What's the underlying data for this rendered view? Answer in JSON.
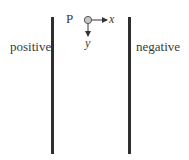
{
  "diagram": {
    "plates": {
      "left": {
        "label": "positive"
      },
      "right": {
        "label": "negative"
      }
    },
    "particle": {
      "label": "P",
      "fill_color": "#c8c8c8",
      "stroke_color": "#555555"
    },
    "axes": {
      "x_label": "x",
      "y_label": "y"
    },
    "colors": {
      "plate": "#2e2e2e",
      "text": "#3a3a3a",
      "background": "#ffffff"
    }
  }
}
